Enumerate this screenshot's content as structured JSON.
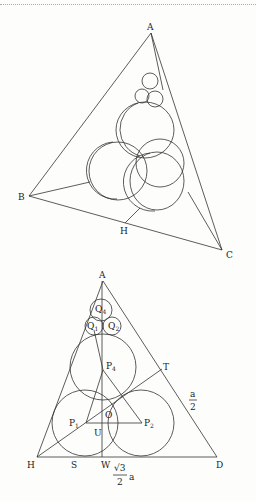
{
  "figure_top": {
    "labels": {
      "A": "A",
      "B": "B",
      "C": "C",
      "H": "H"
    }
  },
  "figure_bottom": {
    "labels": {
      "A": "A",
      "H": "H",
      "D": "D",
      "S": "S",
      "W": "W",
      "T": "T",
      "O": "O",
      "U": "U",
      "P": "P",
      "Q": "Q",
      "sub1": "1",
      "sub2": "2",
      "sub4": "4"
    },
    "side_label_num": "a",
    "side_label_den": "2",
    "base_label_num": "√3",
    "base_label_den": "2",
    "base_label_var": "a"
  }
}
